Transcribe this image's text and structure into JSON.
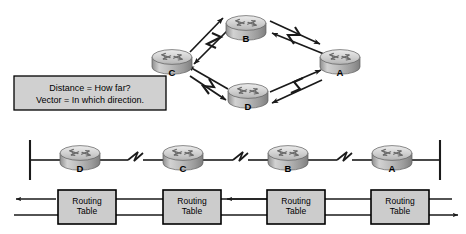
{
  "diagram": {
    "background_color": "#ffffff",
    "line_color": "#1a1a1a",
    "router_body_color": "#b8b8b8",
    "router_top_color": "#d9d9d9",
    "box_fill_color": "#cccccc",
    "box_border_color": "#000000"
  },
  "definition_box": {
    "name": "definition-box",
    "line1": "Distance = How far?",
    "line2": "Vector = In which direction.",
    "x": 14,
    "y": 76,
    "width": 152,
    "height": 34
  },
  "topology_mesh": {
    "name": "mesh-topology",
    "shape": "diamond",
    "link_type_icon": "lightning-bolt-serial-link",
    "routers": [
      {
        "id": "router-b",
        "label": "B",
        "cx": 246,
        "cy": 28,
        "position": "top"
      },
      {
        "id": "router-c",
        "label": "C",
        "cx": 172,
        "cy": 62,
        "position": "left"
      },
      {
        "id": "router-a",
        "label": "A",
        "cx": 340,
        "cy": 62,
        "position": "right"
      },
      {
        "id": "router-d",
        "label": "D",
        "cx": 248,
        "cy": 96,
        "position": "bottom"
      }
    ],
    "links": [
      {
        "from": "C",
        "to": "B",
        "bidirectional": true
      },
      {
        "from": "B",
        "to": "A",
        "bidirectional": true
      },
      {
        "from": "C",
        "to": "D",
        "bidirectional": true
      },
      {
        "from": "D",
        "to": "A",
        "bidirectional": true
      }
    ]
  },
  "topology_linear": {
    "name": "linear-topology",
    "segment_end_left_x": 30,
    "segment_end_right_x": 440,
    "bus_y": 160,
    "routers": [
      {
        "id": "linear-router-d",
        "label": "D",
        "cx": 80,
        "cy": 158
      },
      {
        "id": "linear-router-c",
        "label": "C",
        "cx": 183,
        "cy": 158
      },
      {
        "id": "linear-router-b",
        "label": "B",
        "cx": 288,
        "cy": 158
      },
      {
        "id": "linear-router-a",
        "label": "A",
        "cx": 392,
        "cy": 158
      }
    ],
    "serial_links": [
      {
        "between": "D-C",
        "icon": "lightning-bolt-serial-link",
        "x": 135
      },
      {
        "between": "C-B",
        "icon": "lightning-bolt-serial-link",
        "x": 240
      },
      {
        "between": "B-A",
        "icon": "lightning-bolt-serial-link",
        "x": 344
      }
    ]
  },
  "routing_tables": {
    "name": "routing-table-row",
    "label_line1": "Routing",
    "label_line2": "Table",
    "boxes": [
      {
        "id": "routing-table-d",
        "x": 58,
        "y": 190,
        "width": 58,
        "height": 34,
        "belongs_to": "D"
      },
      {
        "id": "routing-table-c",
        "x": 163,
        "y": 190,
        "width": 58,
        "height": 34,
        "belongs_to": "C"
      },
      {
        "id": "routing-table-b",
        "x": 267,
        "y": 190,
        "width": 58,
        "height": 34,
        "belongs_to": "B"
      },
      {
        "id": "routing-table-a",
        "x": 371,
        "y": 190,
        "width": 58,
        "height": 34,
        "belongs_to": "A"
      }
    ],
    "exchange_direction": "bidirectional"
  }
}
